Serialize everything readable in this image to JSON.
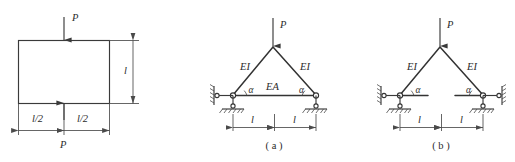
{
  "sheet": {
    "background_color": "#ffffff",
    "line_color": "#3a3a3a",
    "member_color": "#333333"
  },
  "figures": [
    {
      "id": "square-block",
      "caption": "",
      "labels": {
        "load_top": "P",
        "load_bottom": "P",
        "height_dim": "l",
        "half_span_left": "l/2",
        "half_span_right": "l/2"
      }
    },
    {
      "id": "truss-with-tie",
      "caption": "( a )",
      "labels": {
        "load": "P",
        "left_member": "EI",
        "right_member": "EI",
        "tie_member": "EA",
        "left_angle": "α",
        "right_angle": "α",
        "left_span": "l",
        "right_span": "l"
      }
    },
    {
      "id": "truss-no-tie",
      "caption": "( b )",
      "labels": {
        "load": "P",
        "left_member": "EI",
        "right_member": "EI",
        "left_angle": "α",
        "right_angle": "α",
        "left_span": "l",
        "right_span": "l"
      }
    }
  ]
}
